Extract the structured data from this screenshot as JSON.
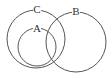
{
  "diagram": {
    "type": "venn",
    "stroke_color": "#555555",
    "background": "#ffffff",
    "sets": [
      {
        "id": "C",
        "label": "C",
        "cx": 36,
        "cy": 39,
        "r": 29,
        "label_x": 37,
        "label_y": 10
      },
      {
        "id": "A",
        "label": "A",
        "cx": 37,
        "cy": 47,
        "r": 19,
        "label_x": 37,
        "label_y": 29
      },
      {
        "id": "B",
        "label": "B",
        "cx": 76,
        "cy": 42,
        "r": 30,
        "label_x": 76,
        "label_y": 12
      }
    ],
    "relations": [
      "A is a subset of C",
      "B overlaps A and C"
    ]
  }
}
